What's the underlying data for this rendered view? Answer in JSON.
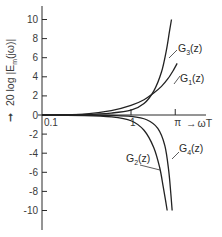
{
  "chart_data": {
    "type": "line",
    "title": "",
    "xlabel": "ωT",
    "ylabel": "20 log |E_m(jω)|",
    "x_scale": "log",
    "x_ticks": [
      {
        "value": 0.1,
        "label": "0.1"
      },
      {
        "value": 1,
        "label": "1"
      },
      {
        "value": 3.14159,
        "label": "π"
      }
    ],
    "y_ticks": [
      10,
      8,
      6,
      4,
      2,
      0,
      -2,
      -4,
      -6,
      -8,
      -10
    ],
    "y_tick_labels": [
      "10",
      "8",
      "6",
      "4",
      "2",
      "0",
      "-2",
      "-4",
      "-6",
      "-8",
      "-10"
    ],
    "ylim": [
      -12,
      11
    ],
    "xlim": [
      0.1,
      5
    ],
    "grid": false,
    "legend": "inline labels",
    "series": [
      {
        "name": "G3(z)",
        "label": "G",
        "sub": "3",
        "arg": "(z)",
        "x": [
          0.1,
          0.3,
          0.6,
          1.0,
          1.4,
          1.8,
          2.2,
          2.5,
          2.7,
          2.85
        ],
        "y": [
          0.0,
          0.05,
          0.2,
          0.5,
          1.2,
          2.5,
          4.5,
          6.8,
          8.7,
          10.0
        ]
      },
      {
        "name": "G1(z)",
        "label": "G",
        "sub": "1",
        "arg": "(z)",
        "x": [
          0.1,
          0.3,
          0.6,
          1.0,
          1.4,
          1.8,
          2.2,
          2.6,
          3.0,
          3.3
        ],
        "y": [
          0.0,
          0.1,
          0.45,
          1.0,
          1.6,
          2.3,
          3.0,
          3.8,
          4.7,
          5.4
        ]
      },
      {
        "name": "G2(z)",
        "label": "G",
        "sub": "2",
        "arg": "(z)",
        "x": [
          0.1,
          0.3,
          0.6,
          1.0,
          1.4,
          1.8,
          2.1,
          2.3,
          2.45,
          2.55
        ],
        "y": [
          0.0,
          -0.05,
          -0.2,
          -0.6,
          -1.6,
          -3.4,
          -5.5,
          -7.5,
          -9.0,
          -10.0
        ]
      },
      {
        "name": "G4(z)",
        "label": "G",
        "sub": "4",
        "arg": "(z)",
        "x": [
          0.1,
          0.3,
          0.6,
          1.0,
          1.5,
          2.0,
          2.4,
          2.65,
          2.8,
          2.9
        ],
        "y": [
          0.0,
          0.0,
          -0.05,
          -0.15,
          -0.5,
          -1.4,
          -3.2,
          -5.8,
          -8.2,
          -10.0
        ]
      }
    ]
  },
  "axis": {
    "y_title_arrow": "➞",
    "y_title_main": "20 log |E",
    "y_title_sub": "m",
    "y_title_tail": "(jω)|",
    "x_title": "ωT",
    "x_title_arrow": "→"
  }
}
